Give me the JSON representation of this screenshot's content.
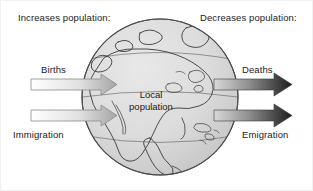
{
  "diagram": {
    "title_left": "Increases population:",
    "title_right": "Decreases population:",
    "center_label_line1": "Local",
    "center_label_line2": "population",
    "inflows": [
      {
        "label": "Births"
      },
      {
        "label": "Immigration"
      }
    ],
    "outflows": [
      {
        "label": "Deaths"
      },
      {
        "label": "Emigration"
      }
    ],
    "globe": {
      "icon": "globe-north-america-icon",
      "fill": "#d8d8d8",
      "stroke": "#555555"
    },
    "colors": {
      "inflow_arrow_light": "#ffffff",
      "inflow_arrow_dark": "#a8a8a8",
      "outflow_arrow_light": "#cfcfcf",
      "outflow_arrow_dark": "#1f1f1f",
      "text": "#1b1b1b",
      "background": "#ffffff"
    }
  }
}
